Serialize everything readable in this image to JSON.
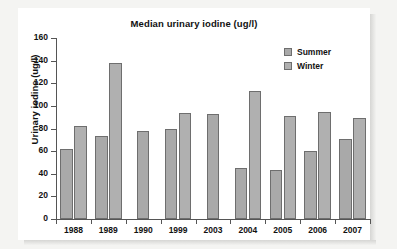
{
  "chart_data": {
    "type": "bar",
    "title": "Median urinary iodine (ug/l)",
    "xlabel": "",
    "ylabel": "Urinary iodine (ug/l)",
    "ylim": [
      0,
      160
    ],
    "ytick_step": 20,
    "yticks": [
      "0",
      "20",
      "40",
      "60",
      "80",
      "100",
      "120",
      "140",
      "160"
    ],
    "grid": false,
    "legend_position": "top-right",
    "categories": [
      "1988",
      "1989",
      "1990",
      "1999",
      "2003",
      "2004",
      "2005",
      "2006",
      "2007"
    ],
    "series": [
      {
        "name": "Summer",
        "color": "#a9a9a9",
        "values": [
          62,
          73,
          78,
          80,
          93,
          45,
          43,
          60,
          71
        ]
      },
      {
        "name": "Winter",
        "color": "#b0b0b0",
        "values": [
          82,
          138,
          null,
          94,
          null,
          113,
          91,
          95,
          89
        ]
      }
    ]
  },
  "legend": {
    "items": [
      {
        "label": "Summer"
      },
      {
        "label": "Winter"
      }
    ]
  }
}
